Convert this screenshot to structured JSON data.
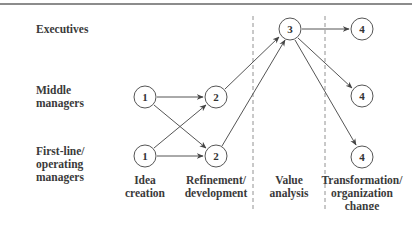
{
  "rows": [
    {
      "id": "executives",
      "label": "Executives",
      "lines": [
        "Executives"
      ]
    },
    {
      "id": "middle",
      "label": "Middle managers",
      "lines": [
        "Middle",
        "managers"
      ]
    },
    {
      "id": "firstline",
      "label": "First-line/ operating managers",
      "lines": [
        "First-line/",
        "operating",
        "managers"
      ]
    }
  ],
  "columns": [
    {
      "id": "idea",
      "lines": [
        "Idea",
        "creation"
      ]
    },
    {
      "id": "refine",
      "lines": [
        "Refinement/",
        "development"
      ]
    },
    {
      "id": "value",
      "lines": [
        "Value",
        "analysis"
      ]
    },
    {
      "id": "transform",
      "lines": [
        "Transformation/",
        "organization",
        "change"
      ]
    }
  ],
  "nodes": [
    {
      "id": "n1_mid",
      "label": "1",
      "row": "middle",
      "stage": "idea"
    },
    {
      "id": "n1_low",
      "label": "1",
      "row": "firstline",
      "stage": "idea"
    },
    {
      "id": "n2_mid",
      "label": "2",
      "row": "middle",
      "stage": "refine"
    },
    {
      "id": "n2_low",
      "label": "2",
      "row": "firstline",
      "stage": "refine"
    },
    {
      "id": "n3_exec",
      "label": "3",
      "row": "executives",
      "stage": "value"
    },
    {
      "id": "n4_exec",
      "label": "4",
      "row": "executives",
      "stage": "transform"
    },
    {
      "id": "n4_mid",
      "label": "4",
      "row": "middle",
      "stage": "transform"
    },
    {
      "id": "n4_low",
      "label": "4",
      "row": "firstline",
      "stage": "transform"
    }
  ],
  "edges": [
    {
      "from": "n1_mid",
      "to": "n2_mid"
    },
    {
      "from": "n1_mid",
      "to": "n2_low"
    },
    {
      "from": "n1_low",
      "to": "n2_mid"
    },
    {
      "from": "n1_low",
      "to": "n2_low"
    },
    {
      "from": "n2_mid",
      "to": "n3_exec"
    },
    {
      "from": "n2_low",
      "to": "n3_exec"
    },
    {
      "from": "n3_exec",
      "to": "n4_exec"
    },
    {
      "from": "n3_exec",
      "to": "n4_mid"
    },
    {
      "from": "n3_exec",
      "to": "n4_low"
    }
  ],
  "labels": {
    "exec": "Executives",
    "mid1": "Middle",
    "mid2": "managers",
    "fl1": "First-line/",
    "fl2": "operating",
    "fl3": "managers",
    "idea1": "Idea",
    "idea2": "creation",
    "ref1": "Refinement/",
    "ref2": "development",
    "val1": "Value",
    "val2": "analysis",
    "tr1": "Transformation/",
    "tr2": "organization",
    "tr3": "change",
    "n1a": "1",
    "n1b": "1",
    "n2a": "2",
    "n2b": "2",
    "n3": "3",
    "n4a": "4",
    "n4b": "4",
    "n4c": "4"
  },
  "colors": {
    "line": "#555555",
    "text": "#333333",
    "background": "#ffffff"
  }
}
